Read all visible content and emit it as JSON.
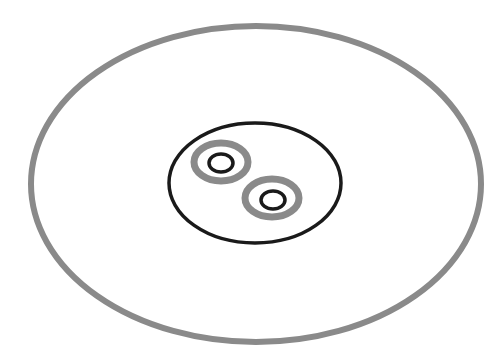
{
  "diagram": {
    "type": "nested-ellipses",
    "background": "#ffffff",
    "colors": {
      "gray": "#8a8a8a",
      "black": "#1a1a1a"
    },
    "outer_ellipse": {
      "cx": 256,
      "cy": 184,
      "rx": 225,
      "ry": 158,
      "stroke": "#8a8a8a",
      "stroke_width": 6
    },
    "inner_ellipse": {
      "cx": 255,
      "cy": 183,
      "rx": 86,
      "ry": 60,
      "stroke": "#1a1a1a",
      "stroke_width": 3.5
    },
    "ring_groups": [
      {
        "outer": {
          "cx": 221,
          "cy": 162,
          "rx": 27,
          "ry": 19,
          "stroke": "#8a8a8a",
          "stroke_width": 7
        },
        "inner": {
          "cx": 221,
          "cy": 163,
          "rx": 12,
          "ry": 9,
          "stroke": "#1a1a1a",
          "stroke_width": 3.5
        }
      },
      {
        "outer": {
          "cx": 272,
          "cy": 198,
          "rx": 27,
          "ry": 19,
          "stroke": "#8a8a8a",
          "stroke_width": 7
        },
        "inner": {
          "cx": 273,
          "cy": 200,
          "rx": 12,
          "ry": 9,
          "stroke": "#1a1a1a",
          "stroke_width": 3.5
        }
      }
    ]
  }
}
